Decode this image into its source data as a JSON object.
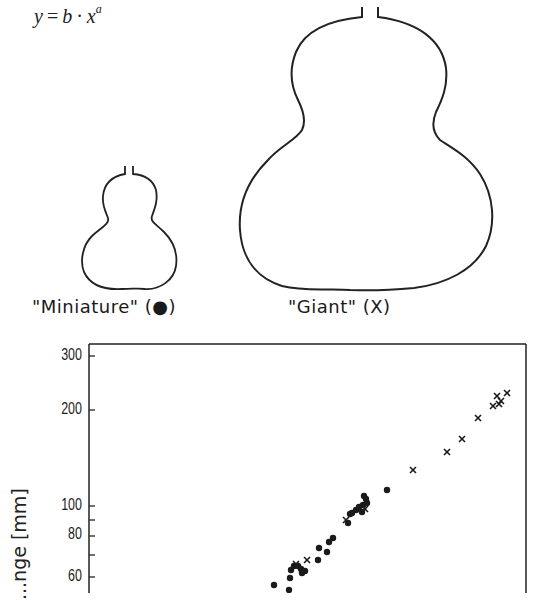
{
  "formula": {
    "lhs": "y",
    "op": "=",
    "b": "b",
    "dot": "·",
    "x": "x",
    "exp": "a"
  },
  "figures": {
    "miniature": {
      "label": "\"Miniature\" (●)"
    },
    "giant": {
      "label": "\"Giant\" (X)"
    }
  },
  "chart_data": {
    "type": "scatter",
    "title": "",
    "xlabel": "",
    "ylabel": "...nge [mm]",
    "y_scale": "log",
    "y_ticks": [
      {
        "label": "300",
        "value": 300
      },
      {
        "label": "200",
        "value": 200
      },
      {
        "label": "100",
        "value": 100
      },
      {
        "label": "80",
        "value": 80
      },
      {
        "label": "60",
        "value": 60
      }
    ],
    "legend": [
      {
        "name": "Miniature",
        "marker": "●"
      },
      {
        "name": "Giant",
        "marker": "×"
      }
    ],
    "series": [
      {
        "name": "Miniature",
        "marker": "dot",
        "points": [
          [
            274,
            585
          ],
          [
            289,
            590
          ],
          [
            290,
            578
          ],
          [
            291,
            570
          ],
          [
            294,
            566
          ],
          [
            298,
            566
          ],
          [
            301,
            569
          ],
          [
            302,
            573
          ],
          [
            305,
            571
          ],
          [
            318,
            560
          ],
          [
            319,
            548
          ],
          [
            327,
            552
          ],
          [
            329,
            542
          ],
          [
            333,
            538
          ],
          [
            348,
            523
          ],
          [
            350,
            514
          ],
          [
            352,
            513
          ],
          [
            356,
            510
          ],
          [
            359,
            507
          ],
          [
            362,
            512
          ],
          [
            363,
            505
          ],
          [
            366,
            499
          ],
          [
            367,
            503
          ],
          [
            364,
            496
          ],
          [
            387,
            490
          ]
        ]
      },
      {
        "name": "Giant",
        "marker": "cross",
        "points": [
          [
            296,
            564
          ],
          [
            307,
            560
          ],
          [
            346,
            520
          ],
          [
            365,
            509
          ],
          [
            413,
            470
          ],
          [
            447,
            452
          ],
          [
            462,
            439
          ],
          [
            478,
            418
          ],
          [
            493,
            406
          ],
          [
            499,
            404
          ],
          [
            497,
            396
          ],
          [
            501,
            401
          ],
          [
            507,
            393
          ]
        ]
      }
    ]
  }
}
